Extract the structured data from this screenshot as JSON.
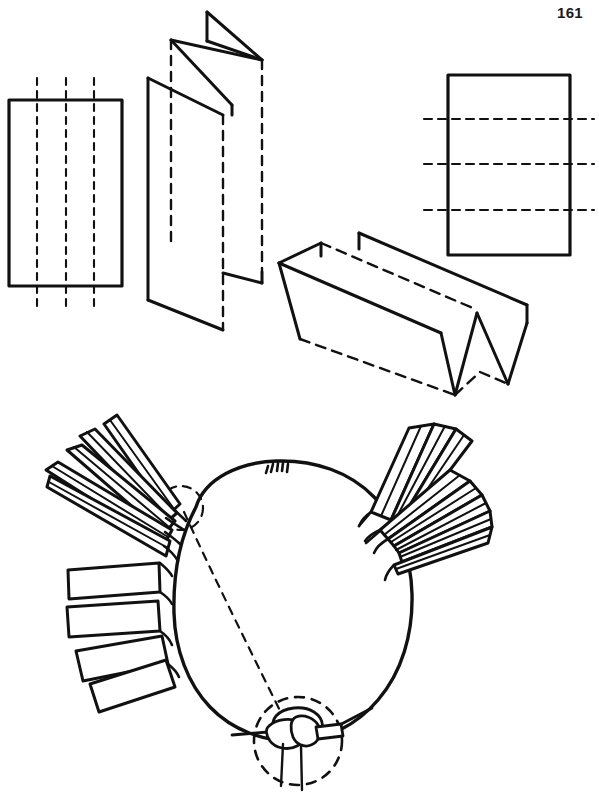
{
  "page": {
    "number": "161",
    "background_color": "#ffffff",
    "ink_color": "#111111",
    "width": 599,
    "height": 802
  },
  "figures": [
    {
      "id": "flat-vertical-folds",
      "name": "rectangle-with-vertical-fold-lines",
      "description": "Flat rectangle marked with three vertical dashed fold lines that extend past the top and bottom edges",
      "rect": {
        "x": 9,
        "y": 100,
        "width": 113,
        "height": 186
      },
      "fold_line_orientation": "vertical",
      "fold_line_count": 3,
      "fold_line_positions_x": [
        37,
        66,
        94
      ],
      "fold_line_overhang": 22,
      "line_style": "dashed",
      "stroke_width": 2.6
    },
    {
      "id": "accordion-vertical",
      "name": "vertically-accordion-folded-sheet",
      "description": "Three-dimensional view of the sheet after folding along the vertical lines, producing an upright accordion of four panels",
      "panel_count": 4,
      "hidden_edges": "dashed",
      "stroke_width": 2.6
    },
    {
      "id": "flat-horizontal-folds",
      "name": "rectangle-with-horizontal-fold-lines",
      "description": "Flat rectangle marked with three horizontal dashed fold lines that extend past the left and right edges",
      "rect": {
        "x": 448,
        "y": 75,
        "width": 122,
        "height": 180
      },
      "fold_line_orientation": "horizontal",
      "fold_line_count": 3,
      "fold_line_positions_y": [
        119,
        164,
        210
      ],
      "fold_line_overhang": 24,
      "line_style": "dashed",
      "stroke_width": 2.6
    },
    {
      "id": "accordion-horizontal",
      "name": "horizontally-accordion-folded-sheet",
      "description": "Three-dimensional view of the sheet after folding along the horizontal lines, producing a sideways accordion of four panels",
      "panel_count": 4,
      "hidden_edges": "dashed",
      "stroke_width": 2.6
    },
    {
      "id": "knotted-ring",
      "name": "knotted-ring-with-fanned-strips",
      "description": "Large hand-drawn ring of cord with two fanned clusters of tapered folded strips bound to it and a knot enclosed in a dashed detail circle at the bottom",
      "ring": {
        "cx": 292,
        "cy": 612,
        "rx": 118,
        "ry": 125
      },
      "strip_clusters": [
        {
          "side": "left",
          "strip_count": 9,
          "shape": "tapered-and-rectangular",
          "spread_degrees": 150
        },
        {
          "side": "right",
          "strip_count": 8,
          "shape": "tapered",
          "spread_degrees": 55
        }
      ],
      "detail_circles": [
        {
          "name": "knot-detail-circle",
          "cx": 298,
          "cy": 741,
          "r": 44,
          "style": "dashed"
        },
        {
          "name": "binding-detail-circle",
          "cx": 181,
          "cy": 508,
          "r": 22,
          "style": "dashed"
        }
      ],
      "guide_line": {
        "name": "knot-alignment-guide",
        "style": "dashed",
        "from": [
          184,
          512
        ],
        "to": [
          293,
          733
        ]
      },
      "top_binding_mark": {
        "cx": 277,
        "cy": 472,
        "description": "small whipping mark at the top of the ring"
      },
      "stroke_width": 2.6
    }
  ]
}
